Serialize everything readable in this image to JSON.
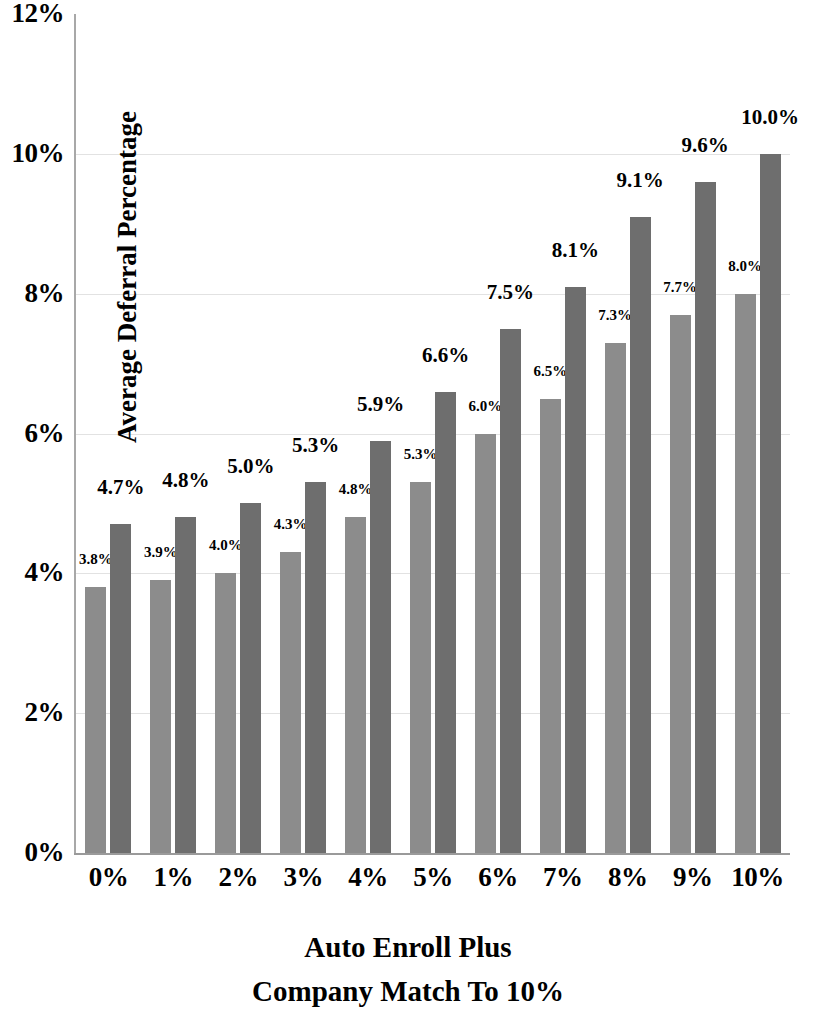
{
  "chart_data": {
    "type": "bar",
    "title": "",
    "xlabel": "Auto Enroll Plus Company Match To 10%",
    "ylabel": "Average Deferral Percentage",
    "categories": [
      "0%",
      "1%",
      "2%",
      "3%",
      "4%",
      "5%",
      "6%",
      "7%",
      "8%",
      "9%",
      "10%"
    ],
    "series": [
      {
        "name": "series-a",
        "color": "#8c8c8c",
        "values": [
          3.8,
          3.9,
          4.0,
          4.3,
          4.8,
          5.3,
          6.0,
          6.5,
          7.3,
          7.7,
          8.0
        ],
        "labels": [
          "3.8%",
          "3.9%",
          "4.0%",
          "4.3%",
          "4.8%",
          "5.3%",
          "6.0%",
          "6.5%",
          "7.3%",
          "7.7%",
          "8.0%"
        ]
      },
      {
        "name": "series-b",
        "color": "#6e6e6e",
        "values": [
          4.7,
          4.8,
          5.0,
          5.3,
          5.9,
          6.6,
          7.5,
          8.1,
          9.1,
          9.6,
          10.0
        ],
        "labels": [
          "4.7%",
          "4.8%",
          "5.0%",
          "5.3%",
          "5.9%",
          "6.6%",
          "7.5%",
          "8.1%",
          "9.1%",
          "9.6%",
          "10.0%"
        ]
      }
    ],
    "ylim": [
      0,
      12
    ],
    "ytick_values": [
      0,
      2,
      4,
      6,
      8,
      10,
      12
    ],
    "ytick_labels": [
      "0%",
      "2%",
      "4%",
      "6%",
      "8%",
      "10%",
      "12%"
    ],
    "grid": "horizontal-faint",
    "legend": "none"
  },
  "axis_titles": {
    "y": "Average Deferral Percentage",
    "x_line1": "Auto Enroll Plus",
    "x_line2": "Company Match To 10%"
  },
  "colors": {
    "series_a": "#8c8c8c",
    "series_b": "#6e6e6e",
    "axis": "#9a9a9a",
    "text": "#000000",
    "background": "#ffffff"
  }
}
